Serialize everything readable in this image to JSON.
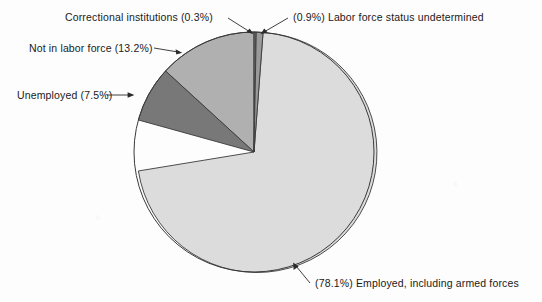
{
  "chart_data": {
    "type": "pie",
    "title": "",
    "subtitle": "",
    "xlabel": "",
    "ylabel": "",
    "legend_position": "none",
    "grid": false,
    "units": "percent",
    "total": 100.0,
    "categories": [
      "Correctional institutions",
      "Labor force status undetermined",
      "Employed, including armed forces",
      "Unemployed",
      "Not in labor force"
    ],
    "values": [
      0.3,
      0.9,
      78.1,
      7.5,
      13.2
    ],
    "slices": [
      {
        "label": "Correctional institutions",
        "value": 0.3,
        "value_text": "(0.3%)",
        "label_text": "Correctional institutions (0.3%)",
        "color": "#6b6b6b",
        "start_angle": 0.0,
        "end_angle": 1.08
      },
      {
        "label": "Labor force status undetermined",
        "value": 0.9,
        "value_text": "(0.9%)",
        "label_text": "(0.9%) Labor force status undetermined",
        "color": "#9a9a9a",
        "start_angle": 1.08,
        "end_angle": 4.32
      },
      {
        "label": "Employed, including armed forces",
        "value": 78.1,
        "value_text": "(78.1%)",
        "label_text": "(78.1%) Employed, including armed forces",
        "color": "#dcdcdc",
        "start_angle": 4.32,
        "end_angle": 285.48
      },
      {
        "label": "Unemployed",
        "value": 7.5,
        "value_text": "(7.5%)",
        "label_text": "Unemployed (7.5%)",
        "color": "#787878",
        "start_angle": 285.48,
        "end_angle": 312.48
      },
      {
        "label": "Not in labor force",
        "value": 13.2,
        "value_text": "(13.2%)",
        "label_text": "Not in labor force (13.2%)",
        "color": "#b0b0b0",
        "start_angle": 312.48,
        "end_angle": 360.0
      }
    ],
    "geometry": {
      "center_x": 254,
      "center_y": 152,
      "radius": 120
    }
  },
  "labels": {
    "correctional": "Correctional institutions (0.3%)",
    "undetermined": "(0.9%) Labor force status undetermined",
    "not_in_labor_force": "Not in labor force (13.2%)",
    "unemployed": "Unemployed (7.5%)",
    "employed": "(78.1%) Employed, including armed forces"
  },
  "colors": {
    "background": "#fdfdfd",
    "outline": "#3a3a3a",
    "text": "#1a1a1a",
    "correctional": "#6b6b6b",
    "undetermined": "#9a9a9a",
    "employed": "#dcdcdc",
    "unemployed": "#787878",
    "not_in_labor_force": "#b0b0b0"
  }
}
